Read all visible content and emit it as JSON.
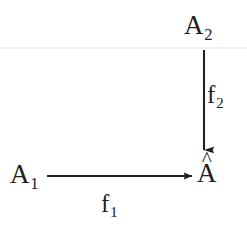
{
  "figure": {
    "kind": "commutative-diagram",
    "background_color": "#ffffff",
    "ink_color": "#231f20",
    "nodes": [
      {
        "id": "a2",
        "base": "A",
        "subscript": "2",
        "accent": "",
        "text": "A₂",
        "x": 197,
        "y": 26
      },
      {
        "id": "a1",
        "base": "A",
        "subscript": "1",
        "accent": "",
        "text": "A₁",
        "x": 23,
        "y": 175
      },
      {
        "id": "ahat",
        "base": "A",
        "subscript": "",
        "accent": "^",
        "text": "Â",
        "x": 207,
        "y": 174
      }
    ],
    "edges": [
      {
        "id": "f2",
        "from": "a2",
        "to": "ahat",
        "orientation": "vertical",
        "direction": "down",
        "label_base": "f",
        "label_subscript": "2",
        "label_text": "f₂",
        "x1": 204,
        "y1": 50,
        "x2": 204,
        "y2": 150
      },
      {
        "id": "f1",
        "from": "a1",
        "to": "ahat",
        "orientation": "horizontal",
        "direction": "right",
        "label_base": "f",
        "label_subscript": "1",
        "label_text": "f₁",
        "x1": 47,
        "y1": 176,
        "x2": 192,
        "y2": 176
      }
    ]
  }
}
